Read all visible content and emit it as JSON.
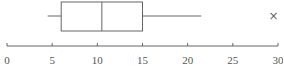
{
  "chart_data": {
    "type": "boxplot",
    "title": "",
    "xlabel": "",
    "ylabel": "",
    "xlim": [
      0,
      30
    ],
    "ticks": [
      0,
      5,
      10,
      15,
      20,
      25,
      30
    ],
    "tick_labels": [
      "0",
      "5",
      "10",
      "15",
      "20",
      "25",
      "30"
    ],
    "grid": false,
    "box": {
      "min": 4.5,
      "q1": 6,
      "median": 10.5,
      "q3": 15,
      "max": 21.5,
      "outliers": [
        29.5
      ]
    },
    "outlier_marker": "×",
    "colors": {
      "line": "#666666",
      "text": "#555555"
    }
  }
}
